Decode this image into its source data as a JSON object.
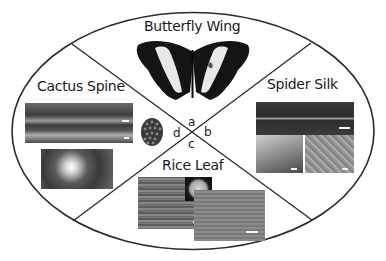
{
  "diagram": {
    "sections": [
      {
        "id": "a",
        "title": "Butterfly Wing",
        "letter": "a"
      },
      {
        "id": "b",
        "title": "Spider Silk",
        "letter": "b"
      },
      {
        "id": "c",
        "title": "Rice Leaf",
        "letter": "c"
      },
      {
        "id": "d",
        "title": "Cactus Spine",
        "letter": "d"
      }
    ],
    "colors": {
      "outline": "#2a2a2a",
      "background": "#ffffff",
      "text": "#1a1a1a"
    }
  }
}
